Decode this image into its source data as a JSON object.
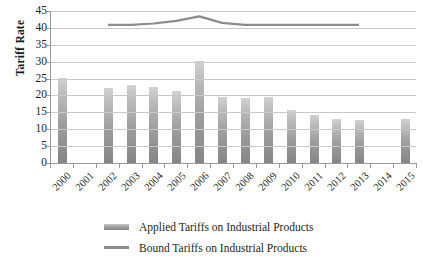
{
  "chart_data": {
    "type": "bar",
    "title": "",
    "xlabel": "",
    "ylabel": "Tariff Rate",
    "ylim": [
      0,
      45
    ],
    "yticks": [
      0,
      5,
      10,
      15,
      20,
      25,
      30,
      35,
      40,
      45
    ],
    "grid": true,
    "legend_position": "bottom",
    "categories": [
      "2000",
      "2001",
      "2002",
      "2003",
      "2004",
      "2005",
      "2006",
      "2007",
      "2008",
      "2009",
      "2010",
      "2011",
      "2012",
      "2013",
      "2014",
      "2015"
    ],
    "series": [
      {
        "name": "Applied Tariffs on Industrial Products",
        "type": "bar",
        "color": "#9d9d9d",
        "values": [
          25.1,
          null,
          22.3,
          23.0,
          22.5,
          21.3,
          30.3,
          19.4,
          19.1,
          19.5,
          15.7,
          14.2,
          12.9,
          12.6,
          null,
          13.1
        ]
      },
      {
        "name": "Bound Tariffs on Industrial Products",
        "type": "line",
        "color": "#8c8c8c",
        "values": [
          null,
          null,
          40.9,
          40.9,
          41.3,
          42.1,
          43.4,
          41.5,
          40.9,
          40.9,
          40.9,
          40.9,
          40.9,
          40.9,
          null,
          null
        ]
      }
    ]
  },
  "legend": {
    "items": [
      {
        "label": "Applied Tariffs on Industrial Products",
        "marker": "bar-swatch"
      },
      {
        "label": "Bound Tariffs on Industrial Products",
        "marker": "line-swatch"
      }
    ]
  }
}
